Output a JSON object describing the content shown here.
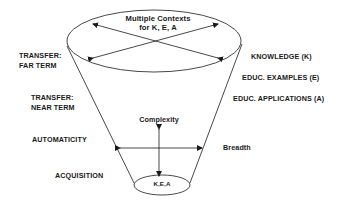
{
  "diagram": {
    "type": "funnel-cone",
    "top_ellipse": {
      "title_line1": "Multiple Contexts",
      "title_line2": "for K, E, A"
    },
    "bottom_ellipse": {
      "label": "K,E,A"
    },
    "axes": {
      "vertical": "Complexity",
      "horizontal": "Breadth"
    },
    "left_labels": [
      {
        "line1": "TRANSFER:",
        "line2": "FAR TERM"
      },
      {
        "line1": "TRANSFER:",
        "line2": "NEAR TERM"
      },
      {
        "line1": "AUTOMATICITY"
      },
      {
        "line1": "ACQUISITION"
      }
    ],
    "right_labels": [
      "KNOWLEDGE (K)",
      "EDUC. EXAMPLES (E)",
      "EDUC. APPLICATIONS (A)"
    ],
    "colors": {
      "stroke": "#1a1a1a",
      "background": "#ffffff"
    }
  }
}
